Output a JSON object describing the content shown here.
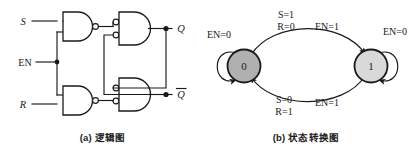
{
  "figure": {
    "panels": [
      {
        "id": "logic-diagram",
        "caption": "(a) 逻辑图",
        "inputs": [
          {
            "name": "S",
            "label": "S"
          },
          {
            "name": "EN",
            "label": "EN"
          },
          {
            "name": "R",
            "label": "R"
          }
        ],
        "outputs": [
          {
            "name": "Q",
            "label": "Q",
            "overbar": false
          },
          {
            "name": "Q-bar",
            "label": "Q",
            "overbar": true
          }
        ],
        "gates": [
          {
            "name": "nand-s-input",
            "type": "NAND"
          },
          {
            "name": "nand-r-input",
            "type": "NAND"
          },
          {
            "name": "nand-q",
            "type": "NAND"
          },
          {
            "name": "nand-q-bar",
            "type": "NAND"
          }
        ]
      },
      {
        "id": "state-transition-diagram",
        "caption": "(b) 状态转换图",
        "states": [
          {
            "name": "state-0",
            "label": "0",
            "fill": "#b0b0b0"
          },
          {
            "name": "state-1",
            "label": "1",
            "fill": "#d9d9d9"
          }
        ],
        "transitions": [
          {
            "name": "loop-state-0",
            "from": "0",
            "to": "0",
            "labels": [
              "EN=0"
            ]
          },
          {
            "name": "transition-0-to-1",
            "from": "0",
            "to": "1",
            "labels": [
              "S=1",
              "R=0",
              "EN=1"
            ]
          },
          {
            "name": "transition-1-to-0",
            "from": "1",
            "to": "0",
            "labels": [
              "S=0",
              "R=1",
              "EN=1"
            ]
          },
          {
            "name": "loop-state-1",
            "from": "1",
            "to": "1",
            "labels": [
              "EN=0"
            ]
          }
        ]
      }
    ]
  },
  "colors": {
    "ink": "#1a1a1a",
    "paper": "#ffffff",
    "state0_fill": "#b0b0b0",
    "state1_fill": "#d9d9d9"
  }
}
